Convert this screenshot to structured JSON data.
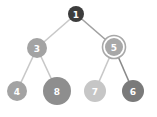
{
  "diagram": {
    "type": "binary-tree",
    "nodes": [
      {
        "id": "1",
        "label": "1",
        "cx": 76,
        "cy": 14,
        "r": 8,
        "fill": "#3c3c3c",
        "font_size": 9,
        "double_ring": false
      },
      {
        "id": "3",
        "label": "3",
        "cx": 37,
        "cy": 48,
        "r": 10,
        "fill": "#a3a3a3",
        "font_size": 9,
        "double_ring": false
      },
      {
        "id": "5",
        "label": "5",
        "cx": 114,
        "cy": 47,
        "r": 9,
        "fill": "#a8a8a8",
        "font_size": 9,
        "double_ring": true
      },
      {
        "id": "4",
        "label": "4",
        "cx": 17,
        "cy": 91,
        "r": 10,
        "fill": "#a3a3a3",
        "font_size": 9,
        "double_ring": false
      },
      {
        "id": "8",
        "label": "8",
        "cx": 57,
        "cy": 91,
        "r": 14,
        "fill": "#8e8e8e",
        "font_size": 9,
        "double_ring": false
      },
      {
        "id": "7",
        "label": "7",
        "cx": 95,
        "cy": 91,
        "r": 11,
        "fill": "#c6c6c6",
        "font_size": 9,
        "double_ring": false
      },
      {
        "id": "6",
        "label": "6",
        "cx": 133,
        "cy": 91,
        "r": 11,
        "fill": "#7a7a7a",
        "font_size": 9,
        "double_ring": false
      }
    ],
    "edges": [
      {
        "from": "1",
        "to": "3",
        "color": "#c8c8c8"
      },
      {
        "from": "1",
        "to": "5",
        "color": "#a0a0a0"
      },
      {
        "from": "3",
        "to": "4",
        "color": "#c8c8c8"
      },
      {
        "from": "3",
        "to": "8",
        "color": "#c8c8c8"
      },
      {
        "from": "5",
        "to": "7",
        "color": "#c8c8c8"
      },
      {
        "from": "5",
        "to": "6",
        "color": "#8a8a8a"
      }
    ]
  }
}
